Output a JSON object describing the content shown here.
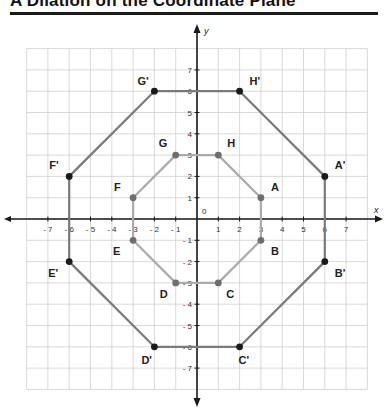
{
  "title": "A Dilation on the Coordinate Plane",
  "colors": {
    "grid": "#cfcfcf",
    "axis": "#1a1a1a",
    "outer_line": "#7a7a7a",
    "outer_point": "#1a1a1a",
    "inner_line": "#ababab",
    "inner_point": "#6e6e6e"
  },
  "axes": {
    "x_label": "x",
    "y_label": "y",
    "origin_label": "0",
    "x_ticks": [
      -7,
      -6,
      -5,
      -4,
      -3,
      -2,
      -1,
      1,
      2,
      3,
      4,
      5,
      6,
      7
    ],
    "y_ticks": [
      7,
      6,
      5,
      4,
      3,
      2,
      1,
      -1,
      -2,
      -3,
      -4,
      -5,
      -6,
      -7
    ],
    "range": [
      -8,
      8
    ]
  },
  "chart_data": {
    "type": "scatter",
    "title": "A Dilation on the Coordinate Plane",
    "xlabel": "x",
    "ylabel": "y",
    "xlim": [
      -8,
      8
    ],
    "ylim": [
      -8,
      8
    ],
    "grid": true,
    "series": [
      {
        "name": "Original octagon ABCDEFGH",
        "closed": true,
        "points": [
          {
            "label": "A",
            "x": 3,
            "y": 1
          },
          {
            "label": "B",
            "x": 3,
            "y": -1
          },
          {
            "label": "C",
            "x": 1,
            "y": -3
          },
          {
            "label": "D",
            "x": -1,
            "y": -3
          },
          {
            "label": "E",
            "x": -3,
            "y": -1
          },
          {
            "label": "F",
            "x": -3,
            "y": 1
          },
          {
            "label": "G",
            "x": -1,
            "y": 3
          },
          {
            "label": "H",
            "x": 1,
            "y": 3
          }
        ]
      },
      {
        "name": "Dilated octagon A'B'C'D'E'F'G'H'",
        "closed": true,
        "points": [
          {
            "label": "A'",
            "x": 6,
            "y": 2
          },
          {
            "label": "B'",
            "x": 6,
            "y": -2
          },
          {
            "label": "C'",
            "x": 2,
            "y": -6
          },
          {
            "label": "D'",
            "x": -2,
            "y": -6
          },
          {
            "label": "E'",
            "x": -6,
            "y": -2
          },
          {
            "label": "F'",
            "x": -6,
            "y": 2
          },
          {
            "label": "G'",
            "x": -2,
            "y": 6
          },
          {
            "label": "H'",
            "x": 2,
            "y": 6
          }
        ]
      }
    ]
  }
}
